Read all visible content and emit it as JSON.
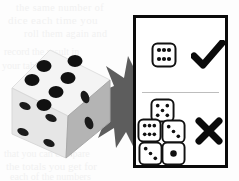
{
  "image": {
    "kind": "instructional-diagram",
    "subject": "dice roll validity",
    "background_color": "#fdfdfd",
    "ink_color": "#0a0a0a"
  },
  "ghost_text": {
    "note": "faint bleed-through text from reverse side of page",
    "color": "#f1f1f1",
    "lines": [
      "the same number of",
      "dice each time you",
      "roll them again and",
      "record the result in",
      "your table below so",
      "that you can compare",
      "the totals you get for",
      "each of the numbers"
    ]
  },
  "big_die": {
    "label": "large three-dimensional die",
    "top_face": {
      "pips": 6,
      "color": "#f4f4f4"
    },
    "left_face": {
      "pips": 4,
      "color": "#e2e2e2"
    },
    "right_face": {
      "pips": 3,
      "color": "#b4b4b4"
    },
    "pip_color": "#111111"
  },
  "starburst": {
    "label": "impact burst behind die",
    "color": "#5d5d5d",
    "points": 14
  },
  "panel": {
    "border_color": "#0a0a0a",
    "fill_color": "#ffffff",
    "divider_color": "#bdbdbd",
    "rows": [
      {
        "id": "correct",
        "verdict": "correct",
        "mark": "check",
        "mark_glyph": "✔",
        "dice_count": 1,
        "dice": [
          {
            "pips": 6,
            "position": "single"
          }
        ]
      },
      {
        "id": "incorrect",
        "verdict": "incorrect",
        "mark": "cross",
        "mark_glyph": "✘",
        "dice_count": 4,
        "dice": [
          {
            "pips": 5,
            "position": "top"
          },
          {
            "pips": 6,
            "position": "middle-left"
          },
          {
            "pips": 3,
            "position": "middle-right"
          },
          {
            "pips": 3,
            "position": "bottom-left"
          },
          {
            "pips": 1,
            "position": "bottom-right"
          }
        ]
      }
    ]
  }
}
